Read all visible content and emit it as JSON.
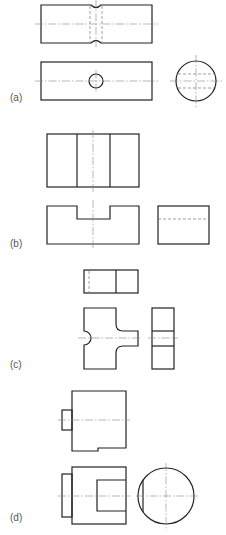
{
  "figure": {
    "panels": [
      {
        "id": "a",
        "label": "(a)",
        "description": "Cylinder with waist groove: front view, top view with cross hole, side view circle"
      },
      {
        "id": "b",
        "label": "(b)",
        "description": "Block with slot: top view, front view with U-notch, side view with hidden line"
      },
      {
        "id": "c",
        "label": "(c)",
        "description": "Cross-shaped part with semicircular cut: top view, front view, side view"
      },
      {
        "id": "d",
        "label": "(d)",
        "description": "Cylindrical part with boss and rectangular cut: front view, top view, side circle view"
      }
    ]
  }
}
